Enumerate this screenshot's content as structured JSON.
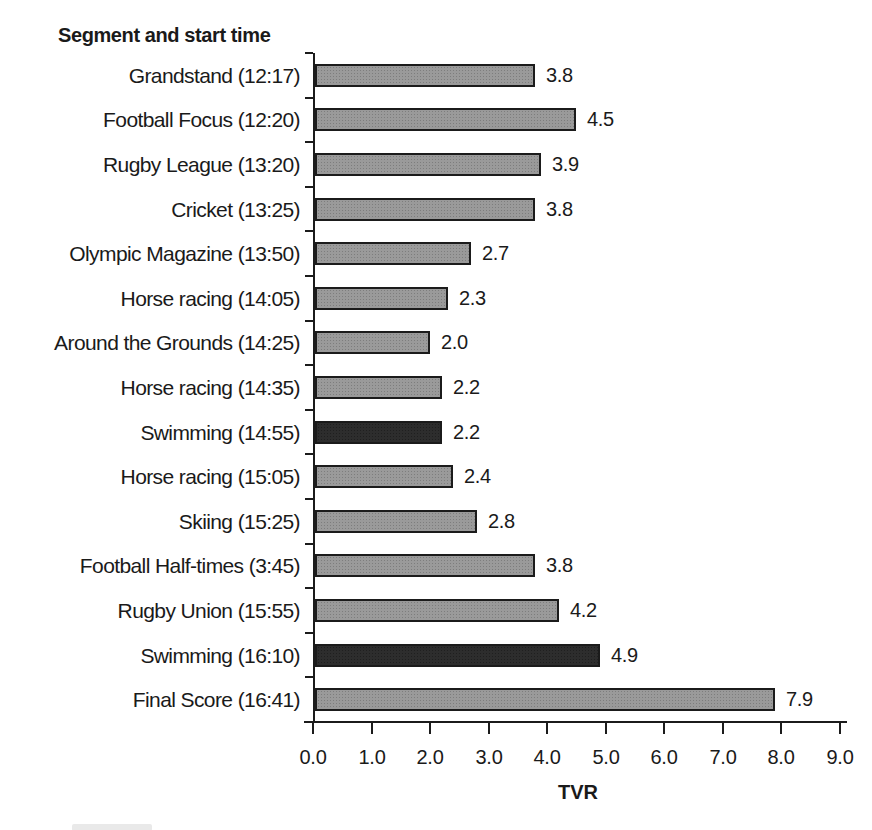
{
  "chart_data": {
    "type": "bar",
    "orientation": "horizontal",
    "title": "Segment and start time",
    "xlabel": "TVR",
    "xlim": [
      0.0,
      9.0
    ],
    "xticks": [
      "0.0",
      "1.0",
      "2.0",
      "3.0",
      "4.0",
      "5.0",
      "6.0",
      "7.0",
      "8.0",
      "9.0"
    ],
    "grid": false,
    "legend": "none",
    "value_labels_shown": true,
    "categories": [
      "Grandstand (12:17)",
      "Football Focus (12:20)",
      "Rugby League (13:20)",
      "Cricket (13:25)",
      "Olympic Magazine (13:50)",
      "Horse racing (14:05)",
      "Around the Grounds (14:25)",
      "Horse racing (14:35)",
      "Swimming (14:55)",
      "Horse racing (15:05)",
      "Skiing (15:25)",
      "Football Half-times (3:45)",
      "Rugby Union (15:55)",
      "Swimming (16:10)",
      "Final Score (16:41)"
    ],
    "values": [
      3.8,
      4.5,
      3.9,
      3.8,
      2.7,
      2.3,
      2.0,
      2.2,
      2.2,
      2.4,
      2.8,
      3.8,
      4.2,
      4.9,
      7.9
    ],
    "highlighted": [
      false,
      false,
      false,
      false,
      false,
      false,
      false,
      false,
      true,
      false,
      false,
      false,
      false,
      true,
      false
    ],
    "colors": {
      "bar": "#9a9a9a",
      "bar_highlight": "#2d2d2d",
      "bar_border": "#1b1b1b",
      "axis": "#1b1b1b",
      "text": "#1a1a1a",
      "background": "#ffffff"
    }
  }
}
